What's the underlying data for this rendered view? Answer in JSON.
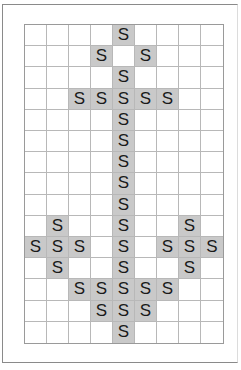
{
  "puzzle": {
    "columns": 9,
    "rows": 15,
    "letter": "S",
    "fill_color": "#c9c9c9",
    "grid": [
      "....S....",
      "...S.S...",
      "....S....",
      "..SSSSS..",
      "....S....",
      "....S....",
      "....S....",
      "....S....",
      "....S....",
      ".S..S..S.",
      "SSS.S.SSS",
      ".S..S..S.",
      "..SSSSS..",
      "...SSS...",
      "....S...."
    ]
  }
}
